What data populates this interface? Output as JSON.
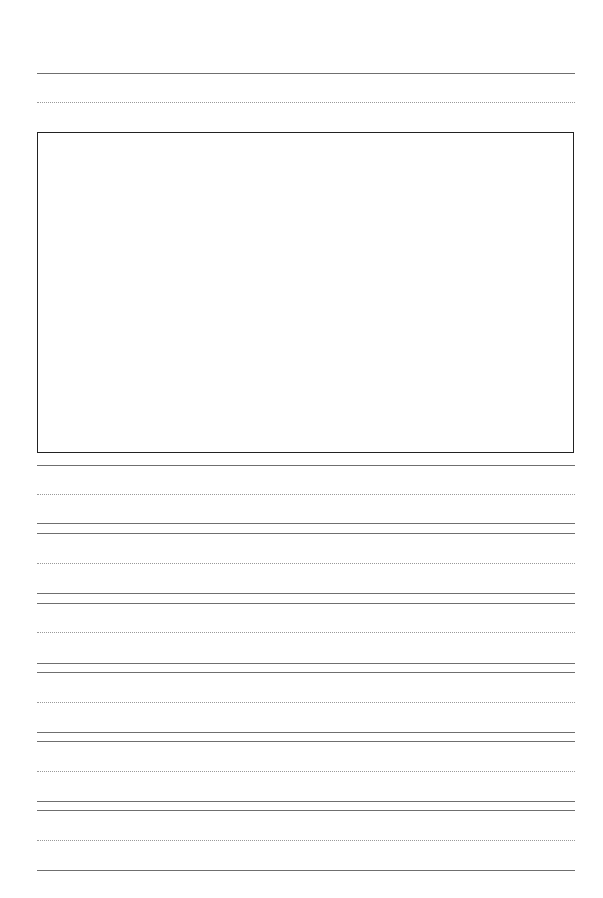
{
  "page": {
    "type": "handwriting-practice-sheet",
    "title": "",
    "colors": {
      "background": "#ffffff",
      "solid_line": "#6f6f6f",
      "dotted_line": "#9a9a9a",
      "box_border": "#222222"
    }
  },
  "title_line": {
    "solid_y": 73,
    "dotted_y": 102
  },
  "drawing_box": {
    "x": 37,
    "y": 132,
    "width": 538,
    "height": 322,
    "content": ""
  },
  "writing_rows": [
    {
      "top_y": 465,
      "mid_y": 494,
      "base_y": 523
    },
    {
      "top_y": 533,
      "mid_y": 563,
      "base_y": 593
    },
    {
      "top_y": 603,
      "mid_y": 632,
      "base_y": 663
    },
    {
      "top_y": 672,
      "mid_y": 702,
      "base_y": 732
    },
    {
      "top_y": 741,
      "mid_y": 771,
      "base_y": 801
    },
    {
      "top_y": 810,
      "mid_y": 840,
      "base_y": 870
    }
  ]
}
